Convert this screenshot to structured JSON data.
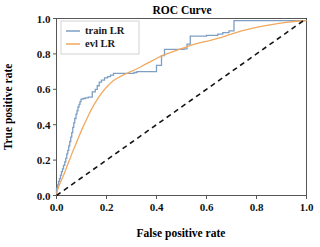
{
  "chart_data": {
    "type": "line",
    "title": "ROC Curve",
    "xlabel": "False positive rate",
    "ylabel": "True positive rate",
    "xlim": [
      0.0,
      1.0
    ],
    "ylim": [
      0.0,
      1.0
    ],
    "grid": false,
    "legend_position": "upper left",
    "xticks": [
      "0.0",
      "0.2",
      "0.4",
      "0.6",
      "0.8",
      "1.0"
    ],
    "xtick_values": [
      0.0,
      0.2,
      0.4,
      0.6,
      0.8,
      1.0
    ],
    "yticks": [
      "0.0",
      "0.2",
      "0.4",
      "0.6",
      "0.8",
      "1.0"
    ],
    "ytick_values": [
      0.0,
      0.2,
      0.4,
      0.6,
      0.8,
      1.0
    ],
    "series": [
      {
        "name": "train LR",
        "color": "#7d9fc4",
        "style": "solid",
        "x": [
          0.0,
          0.0,
          0.004,
          0.004,
          0.008,
          0.008,
          0.012,
          0.012,
          0.016,
          0.016,
          0.02,
          0.02,
          0.024,
          0.024,
          0.028,
          0.028,
          0.033,
          0.033,
          0.037,
          0.037,
          0.041,
          0.041,
          0.045,
          0.045,
          0.049,
          0.049,
          0.053,
          0.053,
          0.057,
          0.057,
          0.061,
          0.061,
          0.065,
          0.065,
          0.069,
          0.069,
          0.073,
          0.073,
          0.078,
          0.078,
          0.082,
          0.082,
          0.086,
          0.086,
          0.09,
          0.09,
          0.094,
          0.094,
          0.098,
          0.098,
          0.106,
          0.106,
          0.115,
          0.115,
          0.127,
          0.127,
          0.143,
          0.143,
          0.155,
          0.155,
          0.163,
          0.163,
          0.171,
          0.171,
          0.18,
          0.18,
          0.192,
          0.192,
          0.204,
          0.204,
          0.216,
          0.216,
          0.228,
          0.228,
          0.31,
          0.31,
          0.322,
          0.322,
          0.4,
          0.4,
          0.42,
          0.42,
          0.432,
          0.432,
          0.51,
          0.51,
          0.522,
          0.522,
          0.535,
          0.535,
          0.6,
          0.6,
          0.645,
          0.645,
          0.665,
          0.665,
          0.69,
          0.69,
          0.71,
          0.71,
          1.0
        ],
        "y": [
          0.0,
          0.04,
          0.04,
          0.06,
          0.06,
          0.08,
          0.08,
          0.095,
          0.095,
          0.115,
          0.115,
          0.135,
          0.135,
          0.15,
          0.15,
          0.17,
          0.17,
          0.19,
          0.19,
          0.21,
          0.21,
          0.235,
          0.235,
          0.255,
          0.255,
          0.28,
          0.28,
          0.305,
          0.305,
          0.33,
          0.33,
          0.355,
          0.355,
          0.385,
          0.385,
          0.41,
          0.41,
          0.435,
          0.435,
          0.46,
          0.46,
          0.48,
          0.48,
          0.5,
          0.5,
          0.515,
          0.515,
          0.53,
          0.53,
          0.545,
          0.545,
          0.548,
          0.548,
          0.552,
          0.552,
          0.556,
          0.556,
          0.585,
          0.585,
          0.6,
          0.6,
          0.62,
          0.62,
          0.64,
          0.64,
          0.652,
          0.652,
          0.665,
          0.665,
          0.672,
          0.672,
          0.68,
          0.68,
          0.69,
          0.69,
          0.695,
          0.695,
          0.7,
          0.7,
          0.735,
          0.735,
          0.79,
          0.79,
          0.825,
          0.825,
          0.828,
          0.828,
          0.855,
          0.855,
          0.9,
          0.9,
          0.905,
          0.905,
          0.912,
          0.912,
          0.92,
          0.92,
          0.93,
          0.93,
          0.988,
          0.988
        ]
      },
      {
        "name": "evl LR",
        "color": "#f0a95f",
        "style": "solid",
        "x": [
          0.0,
          0.004,
          0.008,
          0.012,
          0.018,
          0.024,
          0.03,
          0.036,
          0.042,
          0.048,
          0.055,
          0.062,
          0.07,
          0.078,
          0.086,
          0.094,
          0.102,
          0.112,
          0.122,
          0.132,
          0.142,
          0.152,
          0.164,
          0.176,
          0.188,
          0.2,
          0.214,
          0.228,
          0.244,
          0.26,
          0.278,
          0.296,
          0.316,
          0.336,
          0.356,
          0.378,
          0.4,
          0.422,
          0.444,
          0.466,
          0.488,
          0.512,
          0.536,
          0.56,
          0.584,
          0.608,
          0.634,
          0.66,
          0.686,
          0.712,
          0.74,
          0.77,
          0.8,
          0.83,
          0.86,
          0.89,
          0.92,
          0.95,
          0.975,
          1.0
        ],
        "y": [
          0.0,
          0.03,
          0.048,
          0.062,
          0.082,
          0.1,
          0.12,
          0.142,
          0.165,
          0.188,
          0.212,
          0.238,
          0.265,
          0.292,
          0.32,
          0.348,
          0.375,
          0.405,
          0.435,
          0.465,
          0.492,
          0.518,
          0.545,
          0.57,
          0.592,
          0.612,
          0.632,
          0.65,
          0.664,
          0.676,
          0.688,
          0.7,
          0.712,
          0.726,
          0.742,
          0.758,
          0.774,
          0.79,
          0.802,
          0.813,
          0.824,
          0.836,
          0.848,
          0.858,
          0.866,
          0.874,
          0.884,
          0.894,
          0.906,
          0.918,
          0.93,
          0.94,
          0.95,
          0.958,
          0.966,
          0.972,
          0.978,
          0.983,
          0.986,
          0.988
        ]
      }
    ],
    "reference_line": {
      "name": "chance",
      "color": "#141414",
      "style": "dashed",
      "x": [
        0.0,
        1.0
      ],
      "y": [
        0.0,
        1.0
      ]
    }
  },
  "legend": {
    "entries": [
      {
        "label": "train LR"
      },
      {
        "label": "evl LR"
      }
    ]
  }
}
